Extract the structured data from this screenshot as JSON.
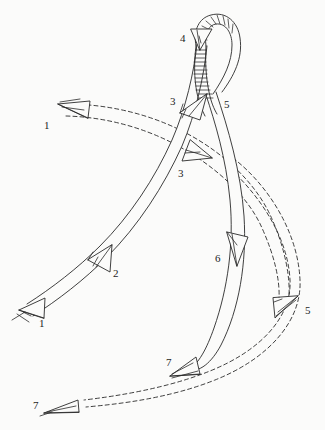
{
  "figure": {
    "background_color": "#fbfbfa",
    "ink_color": "#2a2a2a",
    "width": 325,
    "height": 430
  },
  "labels": [
    {
      "id": "label-1-left",
      "text": "1",
      "x": 44,
      "y": 120
    },
    {
      "id": "label-1-bottomleft",
      "text": "1",
      "x": 39,
      "y": 318
    },
    {
      "id": "label-2",
      "text": "2",
      "x": 113,
      "y": 268
    },
    {
      "id": "label-3-upper",
      "text": "3",
      "x": 170,
      "y": 96
    },
    {
      "id": "label-3-lower",
      "text": "3",
      "x": 178,
      "y": 168
    },
    {
      "id": "label-4",
      "text": "4",
      "x": 180,
      "y": 33
    },
    {
      "id": "label-5-upper",
      "text": "5",
      "x": 224,
      "y": 99
    },
    {
      "id": "label-5-lower",
      "text": "5",
      "x": 305,
      "y": 305
    },
    {
      "id": "label-6",
      "text": "6",
      "x": 215,
      "y": 253
    },
    {
      "id": "label-7-middle",
      "text": "7",
      "x": 166,
      "y": 357
    },
    {
      "id": "label-7-bottomleft",
      "text": "7",
      "x": 33,
      "y": 400
    }
  ],
  "paths": [
    {
      "id": "band-a",
      "name": "solid-band-lower-left-to-upper-right",
      "style": "solid",
      "arrow_labels": [
        "1",
        "2",
        "3",
        "4"
      ],
      "description": "Wide solid-outline band sweeping from lower-left arrow 1 up through arrow 2 and arrow 3 into the hatched loop at arrow 4."
    },
    {
      "id": "band-b",
      "name": "dashed-band-upper-left-to-lower-right",
      "style": "dashed",
      "arrow_labels": [
        "1",
        "3",
        "5"
      ],
      "description": "Dashed-outline band entering at upper-left arrow 1, crossing the solid band at arrow 3 and curving down to arrow 5 on the right."
    },
    {
      "id": "band-c",
      "name": "solid-band-loop-to-lower-left",
      "style": "solid",
      "arrow_labels": [
        "5",
        "6",
        "7"
      ],
      "description": "Solid-outline band descending from the hatched loop through arrow 6 and terminating at arrow 7."
    },
    {
      "id": "band-d",
      "name": "dashed-band-right-to-bottom-left",
      "style": "dashed",
      "arrow_labels": [
        "5",
        "7"
      ],
      "description": "Dashed-outline band sweeping from the right side around the bottom to arrow 7 at lower-left."
    }
  ],
  "arrowheads": [
    {
      "id": "arrow-1-left",
      "label": "1",
      "style": "dashed-band",
      "direction": "left",
      "x": 72,
      "y": 110
    },
    {
      "id": "arrow-1-bottomleft",
      "label": "1",
      "style": "solid-band",
      "direction": "down-left",
      "x": 36,
      "y": 305
    },
    {
      "id": "arrow-2",
      "label": "2",
      "style": "solid-band",
      "direction": "up-right",
      "x": 100,
      "y": 255
    },
    {
      "id": "arrow-3-upper",
      "label": "3",
      "style": "solid-band",
      "direction": "up-right",
      "x": 192,
      "y": 108
    },
    {
      "id": "arrow-3-lower",
      "label": "3",
      "style": "dashed-band",
      "direction": "right",
      "x": 196,
      "y": 152
    },
    {
      "id": "arrow-4",
      "label": "4",
      "style": "solid-band",
      "direction": "down",
      "x": 199,
      "y": 34
    },
    {
      "id": "arrow-6",
      "label": "6",
      "style": "solid-band",
      "direction": "down",
      "x": 236,
      "y": 245
    },
    {
      "id": "arrow-5-lower",
      "label": "5",
      "style": "dashed-band",
      "direction": "down-right",
      "x": 288,
      "y": 305
    },
    {
      "id": "arrow-7-middle",
      "label": "7",
      "style": "solid-band",
      "direction": "down-left",
      "x": 182,
      "y": 363
    },
    {
      "id": "arrow-7-bottomleft",
      "label": "7",
      "style": "dashed-band",
      "direction": "left",
      "x": 73,
      "y": 408
    }
  ]
}
